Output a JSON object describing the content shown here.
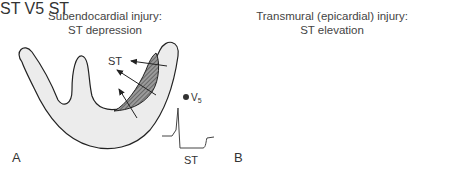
{
  "panels": [
    {
      "id": "A",
      "label": "A",
      "title_line1": "Subendocardial injury:",
      "title_line2": "ST depression",
      "vector_label": "ST",
      "lead_label": "V",
      "lead_subscript": "5",
      "ecg_label": "ST",
      "ecg_pattern": "ST depression"
    },
    {
      "id": "B",
      "label": "B",
      "title_line1": "Transmural (epicardial) injury:",
      "title_line2": "ST elevation",
      "vector_label": "ST",
      "lead_label": "V",
      "lead_subscript": "5",
      "ecg_label": "ST",
      "ecg_pattern": "ST elevation"
    }
  ],
  "colors": {
    "myocardium_fill": "#ececec",
    "outline": "#222222",
    "hatch": "#555555",
    "ecg_trace": "#444444"
  }
}
